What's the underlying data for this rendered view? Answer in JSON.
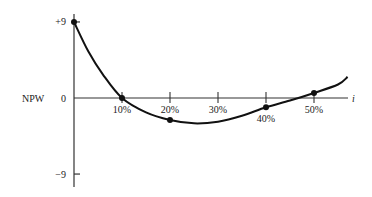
{
  "chart_data": {
    "type": "line",
    "title": "",
    "xlabel": "i",
    "ylabel": "NPW",
    "x_tick_labels": [
      "10%",
      "20%",
      "30%",
      "40%",
      "50%"
    ],
    "y_tick_labels": [
      "+9",
      "0",
      "-9"
    ],
    "ylim": [
      -10.5,
      10
    ],
    "xlim": [
      0,
      0.57
    ],
    "grid": false,
    "legend": null,
    "points": [
      {
        "x": 0.0,
        "y": 9.0
      },
      {
        "x": 0.1,
        "y": 0.0
      },
      {
        "x": 0.2,
        "y": -2.6
      },
      {
        "x": 0.4,
        "y": -1.1
      },
      {
        "x": 0.5,
        "y": 0.6
      }
    ],
    "curve": {
      "x": [
        0.0,
        0.03,
        0.06,
        0.1,
        0.15,
        0.2,
        0.25,
        0.3,
        0.35,
        0.4,
        0.45,
        0.5,
        0.55,
        0.57
      ],
      "y": [
        9.0,
        5.5,
        2.8,
        0.0,
        -1.7,
        -2.6,
        -3.0,
        -2.8,
        -2.1,
        -1.1,
        -0.3,
        0.6,
        1.6,
        2.5
      ]
    },
    "annotations": []
  },
  "axes": {
    "y_axis_label": "NPW",
    "x_axis_label": "i",
    "y_ticks": [
      {
        "label": "+9",
        "value": 9
      },
      {
        "label": "0",
        "value": 0
      },
      {
        "label": "-9",
        "value": -9
      }
    ],
    "x_ticks": [
      {
        "label": "10%",
        "value": 0.1,
        "label_below_curve": false
      },
      {
        "label": "20%",
        "value": 0.2,
        "label_below_curve": false
      },
      {
        "label": "30%",
        "value": 0.3,
        "label_below_curve": false
      },
      {
        "label": "40%",
        "value": 0.4,
        "label_below_curve": true
      },
      {
        "label": "50%",
        "value": 0.5,
        "label_below_curve": false
      }
    ]
  },
  "colors": {
    "line": "#111111",
    "axis": "#333333",
    "text": "#222222",
    "background": "#ffffff"
  }
}
